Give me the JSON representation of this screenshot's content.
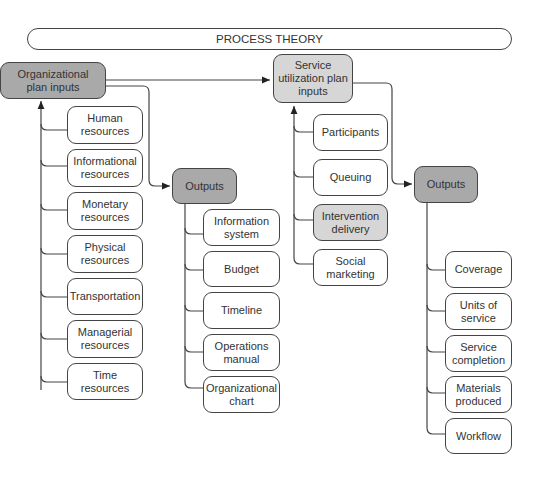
{
  "title": "PROCESS THEORY",
  "organizational": {
    "header": "Organizational\nplan inputs",
    "inputs": [
      "Human\nresources",
      "Informational\nresources",
      "Monetary\nresources",
      "Physical\nresources",
      "Transportation",
      "Managerial\nresources",
      "Time\nresources"
    ],
    "outputs_label": "Outputs",
    "outputs": [
      "Information\nsystem",
      "Budget",
      "Timeline",
      "Operations\nmanual",
      "Organizational\nchart"
    ]
  },
  "service": {
    "header": "Service\nutilization plan\ninputs",
    "inputs": [
      "Participants",
      "Queuing",
      "Intervention\ndelivery",
      "Social\nmarketing"
    ],
    "outputs_label": "Outputs",
    "outputs": [
      "Coverage",
      "Units of\nservice",
      "Service\ncompletion",
      "Materials\nproduced",
      "Workflow"
    ]
  },
  "colors": {
    "header_fill": "#a9a9a9",
    "highlight_fill": "#d6d6d6",
    "line": "#444444"
  }
}
